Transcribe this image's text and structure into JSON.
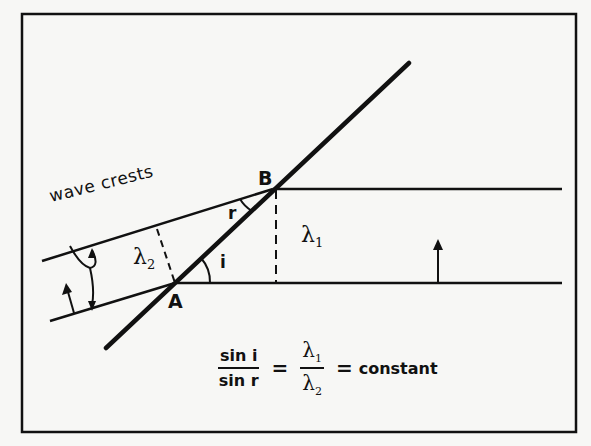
{
  "diagram": {
    "labels": {
      "wave_crests": "wave crests",
      "lambda2": "λ",
      "lambda2_sub": "2",
      "lambda1": "λ",
      "lambda1_sub": "1",
      "point_a": "A",
      "point_b": "B",
      "angle_i": "i",
      "angle_r": "r"
    },
    "equation": {
      "lhs_num": "sin i",
      "lhs_den": "sin r",
      "eq1": "=",
      "mid_num": "λ",
      "mid_num_sub": "1",
      "mid_den": "λ",
      "mid_den_sub": "2",
      "eq2": "=",
      "rhs": "constant"
    },
    "colors": {
      "ink": "#111111",
      "paper": "#f7f7f5"
    }
  }
}
